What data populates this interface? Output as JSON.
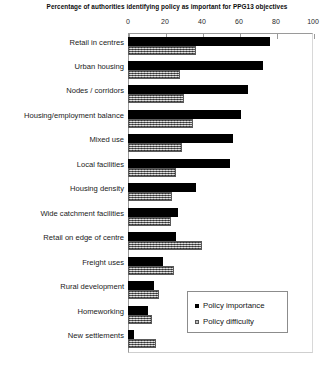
{
  "chart_data": {
    "type": "bar",
    "orientation": "horizontal",
    "title": "Percentage of authorities identifying policy as important for PPG13 objectives",
    "xlabel": "",
    "ylabel": "",
    "xlim": [
      0,
      100
    ],
    "xticks": [
      0,
      20,
      40,
      60,
      80,
      100
    ],
    "grid": false,
    "legend_position": "inside-lower-right",
    "categories": [
      "Retail in centres",
      "Urban housing",
      "Nodes / corridors",
      "Housing/employment balance",
      "Mixed use",
      "Local facilities",
      "Housing density",
      "Wide catchment facilities",
      "Retail on edge of centre",
      "Freight uses",
      "Rural development",
      "Homeworking",
      "New settlements"
    ],
    "series": [
      {
        "name": "Policy importance",
        "color": "#000000",
        "values": [
          77,
          73,
          65,
          61,
          57,
          55,
          37,
          27,
          26,
          19,
          14,
          11,
          3
        ]
      },
      {
        "name": "Policy difficulty",
        "color": "#9f9f9f",
        "values": [
          37,
          28,
          30,
          35,
          29,
          26,
          24,
          23,
          40,
          25,
          17,
          13,
          15
        ]
      }
    ]
  },
  "legend": {
    "entries": [
      {
        "label": "Policy importance"
      },
      {
        "label": "Policy difficulty"
      }
    ]
  }
}
